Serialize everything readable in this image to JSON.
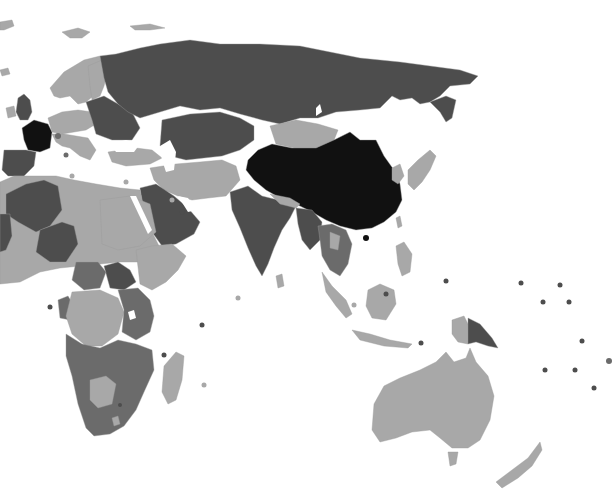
{
  "map": {
    "type": "choropleth",
    "projection_view": "Eastern Hemisphere (Europe, Africa, Asia, Oceania)",
    "width": 612,
    "height": 502,
    "background": "#ffffff",
    "ocean_color": "#ffffff",
    "levels": {
      "light": "#a8a8a8",
      "medium": "#6b6b6b",
      "dark": "#4d4d4d",
      "darkest": "#111111"
    },
    "regions": [
      {
        "name": "greenland-tip",
        "level": "light",
        "points": "0,22 12,20 14,26 4,30 0,30"
      },
      {
        "name": "svalbard",
        "level": "light",
        "points": "62,32 78,28 90,32 82,38 70,38"
      },
      {
        "name": "novaya-zemlya-franz-josef",
        "level": "light",
        "points": "130,26 150,24 165,28 150,30 135,30"
      },
      {
        "name": "iceland",
        "level": "light",
        "points": "0,70 8,68 10,74 2,76"
      },
      {
        "name": "scandinavia",
        "level": "light",
        "points": "50,88 64,72 84,60 100,56 108,62 104,78 98,92 86,102 78,104 70,96 60,98 54,96"
      },
      {
        "name": "finland-baltics",
        "level": "light",
        "points": "88,66 102,60 108,70 104,86 100,96 92,100 90,86"
      },
      {
        "name": "uk",
        "level": "dark",
        "points": "18,98 24,94 30,100 32,112 28,120 20,120 16,112"
      },
      {
        "name": "ireland",
        "level": "light",
        "points": "6,108 14,106 16,116 8,118"
      },
      {
        "name": "france",
        "level": "darkest",
        "points": "22,128 34,120 48,124 52,132 50,148 40,152 28,150 24,140"
      },
      {
        "name": "iberia",
        "level": "dark",
        "points": "4,150 26,150 36,152 34,166 24,176 8,176 2,170"
      },
      {
        "name": "central-europe",
        "level": "light",
        "points": "48,118 62,112 78,110 92,112 96,124 86,130 74,132 62,134 52,132"
      },
      {
        "name": "italy-balkans",
        "level": "light",
        "points": "52,134 64,134 76,136 88,138 96,150 90,160 80,156 70,148 62,146 56,142"
      },
      {
        "name": "eastern-europe",
        "level": "dark",
        "points": "86,102 104,96 118,104 132,112 140,128 132,140 112,140 96,134 92,120"
      },
      {
        "name": "turkey-caucasus",
        "level": "light",
        "points": "108,152 136,148 152,150 162,158 150,164 126,166 112,162"
      },
      {
        "name": "russia",
        "level": "dark",
        "points": "100,56 116,54 140,48 160,44 190,40 220,44 260,44 300,46 330,52 360,58 400,62 430,66 460,70 478,76 470,84 450,86 440,96 430,102 420,104 412,98 400,100 392,96 380,108 360,110 336,112 318,118 300,118 280,124 262,120 240,114 220,108 200,110 180,106 160,112 140,118 128,112 118,104 108,92 104,78"
      },
      {
        "name": "russia-far-east-peninsula",
        "level": "dark",
        "points": "430,102 446,96 456,100 452,118 446,122 440,112"
      },
      {
        "name": "kazakhstan-central-asia",
        "level": "dark",
        "points": "162,120 190,114 220,112 240,118 254,126 254,140 240,150 222,156 204,158 186,160 170,156 160,146"
      },
      {
        "name": "mongolia",
        "level": "light",
        "points": "270,126 296,120 318,124 338,130 334,140 316,148 294,148 276,144"
      },
      {
        "name": "china",
        "level": "darkest",
        "points": "248,160 258,150 272,144 292,148 316,148 334,140 350,132 360,140 376,140 384,156 394,170 400,184 402,200 396,212 384,222 372,228 356,230 340,226 326,220 312,212 296,204 280,198 266,190 254,180 246,170"
      },
      {
        "name": "korea",
        "level": "light",
        "points": "392,168 400,164 404,176 398,184 392,180"
      },
      {
        "name": "japan",
        "level": "light",
        "points": "408,170 418,160 430,150 436,156 430,170 422,182 414,190 408,184"
      },
      {
        "name": "taiwan",
        "level": "light",
        "points": "396,218 400,216 402,226 398,228"
      },
      {
        "name": "iran-afghanistan-pakistan",
        "level": "light",
        "points": "150,168 176,164 200,162 222,160 236,166 240,180 226,196 208,198 192,200 178,196 164,190 154,180"
      },
      {
        "name": "arabia",
        "level": "dark",
        "points": "140,188 156,184 174,196 188,208 200,222 194,234 176,244 162,246 152,232 144,214"
      },
      {
        "name": "india",
        "level": "dark",
        "points": "230,192 248,186 262,196 278,200 296,206 290,218 282,230 274,248 268,264 262,276 256,266 248,248 240,228 232,210"
      },
      {
        "name": "sri-lanka",
        "level": "light",
        "points": "276,276 282,274 284,286 278,288"
      },
      {
        "name": "nepal-bhutan",
        "level": "light",
        "points": "270,194 290,198 300,204 296,208 280,204"
      },
      {
        "name": "myanmar-bangladesh",
        "level": "dark",
        "points": "296,208 312,210 322,222 320,240 310,250 302,240 298,224"
      },
      {
        "name": "indochina",
        "level": "medium",
        "points": "318,226 332,224 346,230 352,244 348,264 340,276 330,270 322,256 320,240"
      },
      {
        "name": "laos-thailand-light",
        "level": "light",
        "points": "330,232 340,236 338,250 330,248"
      },
      {
        "name": "philippines",
        "level": "light",
        "points": "396,246 404,242 412,254 410,272 402,276 398,264"
      },
      {
        "name": "malay-sumatra",
        "level": "light",
        "points": "322,272 332,286 346,300 352,314 346,318 336,306 326,292"
      },
      {
        "name": "borneo",
        "level": "light",
        "points": "368,290 380,284 394,290 396,304 386,320 372,318 366,306"
      },
      {
        "name": "sulawesi-java",
        "level": "light",
        "points": "352,330 370,334 390,340 412,344 408,348 384,346 360,340"
      },
      {
        "name": "new-guinea-west",
        "level": "light",
        "points": "452,320 464,316 470,328 468,344 458,342 452,334"
      },
      {
        "name": "papua-new-guinea",
        "level": "dark",
        "points": "468,318 480,324 492,338 498,348 488,346 476,342 468,344"
      },
      {
        "name": "australia",
        "level": "light",
        "points": "374,404 384,386 400,378 420,370 436,362 446,352 454,362 466,358 470,348 476,362 488,376 494,396 490,420 480,440 468,448 452,448 440,438 430,430 412,432 396,438 380,442 372,430"
      },
      {
        "name": "tasmania",
        "level": "light",
        "points": "448,452 458,452 456,464 450,466"
      },
      {
        "name": "new-zealand",
        "level": "light",
        "points": "496,482 512,470 528,458 540,442 542,450 532,466 518,478 502,488"
      },
      {
        "name": "north-africa-west",
        "level": "light",
        "points": "0,182 14,176 36,176 56,176 74,180 96,184 120,188 140,190 144,208 152,232 160,248 152,258 138,262 120,262 100,264 80,266 60,268 40,272 20,282 0,284"
      },
      {
        "name": "algeria-libya-dark",
        "level": "dark",
        "points": "6,194 26,184 44,180 58,186 62,210 50,226 36,232 18,222 6,214"
      },
      {
        "name": "niger-chad-dark",
        "level": "dark",
        "points": "40,230 62,222 74,226 78,244 66,262 50,262 36,252"
      },
      {
        "name": "mali-dark",
        "level": "dark",
        "points": "0,214 10,214 12,236 6,250 0,252"
      },
      {
        "name": "sudan-light",
        "level": "light",
        "points": "100,200 130,196 150,204 156,232 140,246 118,250 102,244"
      },
      {
        "name": "south-sudan",
        "level": "dark",
        "points": "104,266 118,262 130,270 136,282 124,290 110,288"
      },
      {
        "name": "ethiopia-horn",
        "level": "light",
        "points": "136,250 152,246 172,244 186,256 178,270 166,282 152,290 140,284"
      },
      {
        "name": "central-africa-dark",
        "level": "medium",
        "points": "76,262 98,262 106,272 100,288 84,290 72,280"
      },
      {
        "name": "gabon-congo",
        "level": "medium",
        "points": "58,300 68,296 74,306 70,320 60,318"
      },
      {
        "name": "drc",
        "level": "light",
        "points": "72,292 100,290 118,298 124,312 118,334 102,346 86,346 72,334 66,316"
      },
      {
        "name": "east-africa",
        "level": "medium",
        "points": "118,290 138,288 150,300 154,316 150,332 136,340 122,332 124,310"
      },
      {
        "name": "southern-africa",
        "level": "medium",
        "points": "66,334 82,344 100,348 118,340 136,344 152,350 154,370 144,392 136,410 124,426 110,434 94,436 86,428 78,404 72,376 66,356"
      },
      {
        "name": "botswana",
        "level": "light",
        "points": "90,380 106,376 116,384 112,404 98,408 90,400"
      },
      {
        "name": "lesotho",
        "level": "light",
        "points": "112,418 118,416 120,424 114,426"
      },
      {
        "name": "madagascar",
        "level": "light",
        "points": "164,366 176,352 184,356 182,380 176,400 168,404 162,392"
      }
    ],
    "markers": [
      {
        "name": "island-dot",
        "level": "medium",
        "cx": 58,
        "cy": 136,
        "r": 3
      },
      {
        "name": "island-dot",
        "level": "medium",
        "cx": 66,
        "cy": 155,
        "r": 2.5
      },
      {
        "name": "island-dot",
        "level": "light",
        "cx": 72,
        "cy": 176,
        "r": 2.5
      },
      {
        "name": "island-dot",
        "level": "light",
        "cx": 126,
        "cy": 182,
        "r": 2.5
      },
      {
        "name": "island-dot",
        "level": "light",
        "cx": 172,
        "cy": 200,
        "r": 2.5
      },
      {
        "name": "island-dot",
        "level": "dark",
        "cx": 182,
        "cy": 212,
        "r": 2.5
      },
      {
        "name": "island-dot",
        "level": "dark",
        "cx": 50,
        "cy": 307,
        "r": 2.5
      },
      {
        "name": "island-dot",
        "level": "light",
        "cx": 238,
        "cy": 298,
        "r": 2.5
      },
      {
        "name": "island-dot",
        "level": "dark",
        "cx": 202,
        "cy": 325,
        "r": 2.5
      },
      {
        "name": "island-dot",
        "level": "dark",
        "cx": 164,
        "cy": 355,
        "r": 2.5
      },
      {
        "name": "island-dot",
        "level": "light",
        "cx": 204,
        "cy": 385,
        "r": 2.5
      },
      {
        "name": "island-dot",
        "level": "darkest",
        "cx": 366,
        "cy": 238,
        "r": 3
      },
      {
        "name": "island-dot",
        "level": "dark",
        "cx": 386,
        "cy": 294,
        "r": 2.5
      },
      {
        "name": "island-dot",
        "level": "light",
        "cx": 354,
        "cy": 305,
        "r": 2.5
      },
      {
        "name": "island-dot",
        "level": "dark",
        "cx": 421,
        "cy": 343,
        "r": 2.5
      },
      {
        "name": "island-dot",
        "level": "dark",
        "cx": 446,
        "cy": 281,
        "r": 2.5
      },
      {
        "name": "island-dot",
        "level": "dark",
        "cx": 521,
        "cy": 283,
        "r": 2.5
      },
      {
        "name": "island-dot",
        "level": "dark",
        "cx": 560,
        "cy": 285,
        "r": 2.5
      },
      {
        "name": "island-dot",
        "level": "dark",
        "cx": 543,
        "cy": 302,
        "r": 2.5
      },
      {
        "name": "island-dot",
        "level": "dark",
        "cx": 569,
        "cy": 302,
        "r": 2.5
      },
      {
        "name": "island-dot",
        "level": "dark",
        "cx": 582,
        "cy": 341,
        "r": 2.5
      },
      {
        "name": "island-dot",
        "level": "dark",
        "cx": 545,
        "cy": 370,
        "r": 2.5
      },
      {
        "name": "island-dot",
        "level": "dark",
        "cx": 575,
        "cy": 370,
        "r": 2.5
      },
      {
        "name": "island-dot",
        "level": "dark",
        "cx": 594,
        "cy": 388,
        "r": 2.5
      },
      {
        "name": "island-dot",
        "level": "medium",
        "cx": 609,
        "cy": 361,
        "r": 3
      },
      {
        "name": "island-dot",
        "level": "dark",
        "cx": 120,
        "cy": 405,
        "r": 2
      }
    ],
    "lakes": [
      {
        "name": "caspian-sea",
        "points": "160,146 170,140 176,152 174,170 166,172 162,160"
      },
      {
        "name": "lake-baikal",
        "points": "316,108 320,104 322,112 316,116"
      },
      {
        "name": "red-sea",
        "points": "130,196 136,196 152,230 148,234"
      },
      {
        "name": "lake-victoria",
        "points": "128,312 134,310 136,318 130,320"
      },
      {
        "name": "black-sea",
        "points": "110,144 126,140 140,144 134,152 116,152"
      },
      {
        "name": "persian-gulf",
        "points": "178,196 188,198 196,210 188,212"
      }
    ]
  }
}
